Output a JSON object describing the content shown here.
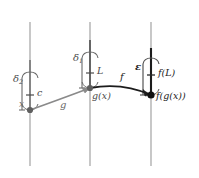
{
  "figure": {
    "type": "math-diagram",
    "colors": {
      "axis_light": "#9a9a9a",
      "axis_mid": "#6f6f6f",
      "curve_dark": "#1c1c1c",
      "curve_grey": "#6b6b6b",
      "bracket": "#555555",
      "text": "#3d3d3d"
    },
    "axes": [
      {
        "name": "x-axis-line",
        "x": 30,
        "top": 22,
        "bottom": 166
      },
      {
        "name": "g-axis-line",
        "x": 90,
        "top": 22,
        "bottom": 166
      },
      {
        "name": "f-axis-line",
        "x": 151,
        "top": 22,
        "bottom": 166
      }
    ],
    "points": [
      {
        "name": "point-x",
        "cx": 30,
        "cy": 110,
        "label": "x",
        "label_x": 20,
        "label_y": 102
      },
      {
        "name": "point-gx",
        "cx": 90,
        "cy": 88,
        "label": "g(x)",
        "label_x": 93,
        "label_y": 92
      },
      {
        "name": "point-fgx",
        "cx": 151,
        "cy": 95,
        "label": "f(g(x))",
        "label_x": 156,
        "label_y": 92
      }
    ],
    "ticks": [
      {
        "name": "tick-c",
        "x": 30,
        "y": 95,
        "label": "c",
        "label_x": 37,
        "label_y": 89
      },
      {
        "name": "tick-L",
        "x": 90,
        "y": 73,
        "label": "L",
        "label_x": 97,
        "label_y": 67
      },
      {
        "name": "tick-fL",
        "x": 151,
        "y": 75,
        "label": "f(L)",
        "label_x": 158,
        "label_y": 69
      }
    ],
    "brackets": [
      {
        "name": "bracket-delta2",
        "x": 30,
        "top": 72,
        "bottom": 110,
        "label": "δ",
        "sub": "2",
        "label_x": 13,
        "label_y": 80
      },
      {
        "name": "bracket-delta1",
        "x": 90,
        "top": 52,
        "bottom": 88,
        "label": "δ",
        "sub": "1",
        "label_x": 73,
        "label_y": 58
      },
      {
        "name": "bracket-epsilon",
        "x": 151,
        "top": 58,
        "bottom": 95,
        "label": "ε",
        "sub": "",
        "label_x": 136,
        "label_y": 68
      }
    ],
    "arrows": [
      {
        "name": "arrow-g",
        "label": "g",
        "label_x": 61,
        "label_y": 104,
        "from_x": 30,
        "from_y": 110,
        "to_x": 90,
        "to_y": 88
      },
      {
        "name": "arrow-f",
        "label": "f",
        "label_x": 120,
        "label_y": 76,
        "from_x": 90,
        "from_y": 88,
        "to_x": 151,
        "to_y": 95
      }
    ]
  }
}
